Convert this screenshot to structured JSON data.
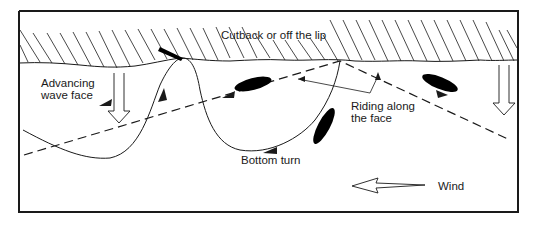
{
  "diagram": {
    "type": "surfing manoeuvre diagram",
    "labels": {
      "cutback": "Cutback or off the lip",
      "advancing_line1": "Advancing",
      "advancing_line2": "wave face",
      "riding_line1": "Riding along",
      "riding_line2": "the face",
      "bottom_turn": "Bottom turn",
      "wind": "Wind"
    },
    "colors": {
      "line": "#1a1a1a",
      "background": "#ffffff",
      "board": "#000000"
    }
  }
}
